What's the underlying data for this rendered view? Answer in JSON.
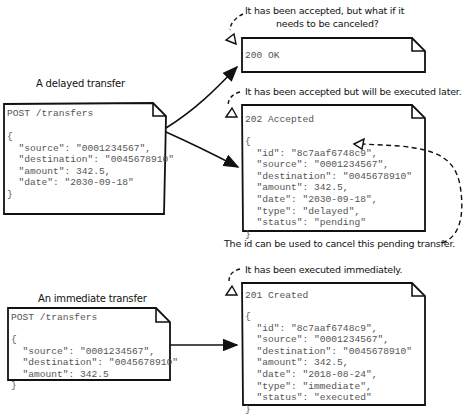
{
  "captions": {
    "delayed_title": "A delayed transfer",
    "immediate_title": "An immediate transfer",
    "ok_note": "It has been accepted, but what if it\nneeds to be canceled?",
    "ok_note_line1": "It has been accepted, but what if it",
    "ok_note_line2": "needs to be canceled?",
    "accepted_note": "It has been accepted but will be executed later.",
    "id_note": "The id can be used to cancel this pending transfer.",
    "created_note": "It has been executed immediately."
  },
  "requests": {
    "delayed": {
      "request_line": "POST /transfers",
      "body": "{\n  \"source\": \"0001234567\",\n  \"destination\": \"0045678910\"\n  \"amount\": 342.5,\n  \"date\": \"2030-09-18\"\n}"
    },
    "immediate": {
      "request_line": "POST /transfers",
      "body": "{\n  \"source\": \"0001234567\",\n  \"destination\": \"0045678910\"\n  \"amount\": 342.5\n}"
    }
  },
  "responses": {
    "ok": {
      "status_line": "200 OK"
    },
    "accepted": {
      "status_line": "202 Accepted",
      "body": "{\n  \"id\": \"8c7aaf6748c9\",\n  \"source\": \"0001234567\",\n  \"destination\": \"0045678910\"\n  \"amount\": 342.5,\n  \"date\": \"2030-09-18\",\n  \"type\": \"delayed\",\n  \"status\": \"pending\"\n}"
    },
    "created": {
      "status_line": "201 Created",
      "body": "{\n  \"id\": \"8c7aaf6748c9\",\n  \"source\": \"0001234567\",\n  \"destination\": \"0045678910\"\n  \"amount\": 342.5,\n  \"date\": \"2018-08-24\",\n  \"type\": \"immediate\",\n  \"status\": \"executed\"\n}"
    }
  },
  "colors": {
    "stroke": "#111111",
    "code_text": "#555555",
    "background": "#ffffff"
  }
}
